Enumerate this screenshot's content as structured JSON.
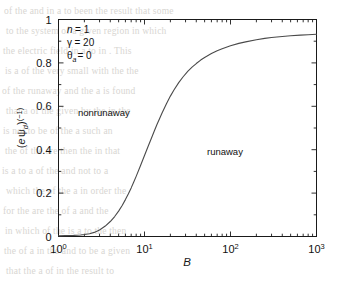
{
  "figure": {
    "background_color": "#ffffff",
    "line_color": "#4a4a4a",
    "axis_color": "#1a1a1a"
  },
  "annotations": {
    "n_label": "n",
    "n_eq": "= 1",
    "gamma_label": "γ",
    "gamma_eq": "= 20",
    "theta_label": "θ",
    "theta_sub": "a",
    "theta_eq": "= 0",
    "region_nonrunaway": "nonrunaway",
    "region_runaway": "runaway"
  },
  "axes": {
    "xlabel": "B",
    "ylabel_parts": {
      "open": "(",
      "e": "e",
      "psi": "ψ",
      "psi_sub": "d",
      "close": ")",
      "exp": "(−1)"
    },
    "xticklabels": [
      {
        "mantissa": "10",
        "exponent": "0"
      },
      {
        "mantissa": "10",
        "exponent": "1"
      },
      {
        "mantissa": "10",
        "exponent": "2"
      },
      {
        "mantissa": "10",
        "exponent": "3"
      }
    ],
    "yticklabels": [
      "0",
      "0.2",
      "0.4",
      "0.6",
      "0.8",
      "1"
    ]
  },
  "chart_data": {
    "type": "line",
    "title": "",
    "xlabel": "B",
    "ylabel": "(e ψ_d)^(-1)",
    "xscale": "log",
    "yscale": "linear",
    "xlim": [
      1,
      1000
    ],
    "ylim": [
      0,
      1
    ],
    "xticks": [
      1,
      10,
      100,
      1000
    ],
    "yticks": [
      0,
      0.2,
      0.4,
      0.6,
      0.8,
      1.0
    ],
    "grid": false,
    "legend": "none",
    "annotations": [
      "n = 1",
      "γ = 20",
      "θ_a = 0",
      "nonrunaway",
      "runaway"
    ],
    "series": [
      {
        "name": "runaway boundary",
        "x": [
          1.0,
          1.2,
          1.5,
          1.8,
          2.0,
          2.3,
          2.6,
          3.0,
          3.5,
          4.0,
          4.5,
          5.0,
          5.5,
          6.0,
          6.5,
          7.0,
          7.5,
          8.0,
          9.0,
          10.0,
          11.0,
          12.0,
          13.0,
          14.0,
          15.0,
          16.0,
          18.0,
          20.0,
          22.0,
          25.0,
          28.0,
          32.0,
          36.0,
          40.0,
          45.0,
          50.0,
          60.0,
          70.0,
          80.0,
          100.0,
          125.0,
          150.0,
          200.0,
          250.0,
          300.0,
          400.0,
          500.0,
          650.0,
          800.0,
          1000.0
        ],
        "y": [
          0.003,
          0.004,
          0.005,
          0.007,
          0.009,
          0.013,
          0.019,
          0.03,
          0.048,
          0.069,
          0.092,
          0.117,
          0.143,
          0.17,
          0.197,
          0.224,
          0.251,
          0.277,
          0.327,
          0.373,
          0.415,
          0.452,
          0.486,
          0.517,
          0.544,
          0.569,
          0.612,
          0.647,
          0.675,
          0.709,
          0.735,
          0.762,
          0.782,
          0.797,
          0.813,
          0.825,
          0.843,
          0.856,
          0.865,
          0.879,
          0.89,
          0.897,
          0.907,
          0.913,
          0.917,
          0.922,
          0.925,
          0.928,
          0.93,
          0.932
        ]
      }
    ]
  },
  "page_bleed": {
    "lines": [
      {
        "x": 4,
        "y": 6,
        "text": "of the and in a to been the result that some"
      },
      {
        "x": 6,
        "y": 26,
        "text": "to the system of a given region in which"
      },
      {
        "x": 3,
        "y": 46,
        "text": "the electric field in a to in  . This"
      },
      {
        "x": 5,
        "y": 66,
        "text": "is a of the very small with the the"
      },
      {
        "x": 2,
        "y": 86,
        "text": "of the runaway and the a is found"
      },
      {
        "x": 6,
        "y": 106,
        "text": "that a of the given by the in the"
      },
      {
        "x": 3,
        "y": 126,
        "text": "is not to be of the a such an"
      },
      {
        "x": 5,
        "y": 146,
        "text": "the of the are then the in that"
      },
      {
        "x": 2,
        "y": 166,
        "text": "is a to a of the and not to a"
      },
      {
        "x": 6,
        "y": 186,
        "text": "which the of the a in order the"
      },
      {
        "x": 3,
        "y": 206,
        "text": "for the are the of a and the"
      },
      {
        "x": 5,
        "y": 226,
        "text": "in which of the is a to the then"
      },
      {
        "x": 4,
        "y": 246,
        "text": "the of a in the and to be a given"
      },
      {
        "x": 6,
        "y": 266,
        "text": "that the a of in the result to"
      }
    ]
  }
}
